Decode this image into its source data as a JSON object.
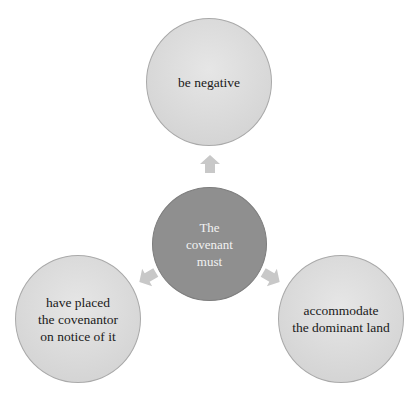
{
  "diagram": {
    "type": "radial-cycle",
    "center": {
      "label": "The\ncovenant\nmust"
    },
    "nodes": [
      {
        "id": "top",
        "label": "be negative"
      },
      {
        "id": "left",
        "label": "have placed\nthe covenantor\non notice of it"
      },
      {
        "id": "right",
        "label": "accommodate\nthe dominant land"
      }
    ],
    "arrows": [
      {
        "from": "center",
        "to": "top",
        "direction": "up"
      },
      {
        "from": "center",
        "to": "left",
        "direction": "down-left"
      },
      {
        "from": "center",
        "to": "right",
        "direction": "down-right"
      }
    ],
    "colors": {
      "outer_fill": "#d9d9d9",
      "outer_border": "#a9a9a9",
      "center_fill": "#8f8f8f",
      "arrow_fill": "#c8c8c8",
      "center_text": "#f2f2f2",
      "outer_text": "#1a1a1a"
    }
  }
}
